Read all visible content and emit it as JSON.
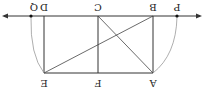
{
  "diagram": {
    "orientation": "rotated-180",
    "labels": {
      "P": "P",
      "B": "B",
      "C": "C",
      "D": "D",
      "Q": "Q",
      "A": "A",
      "F": "F",
      "E": "E"
    },
    "points": {
      "Q": [
        31,
        16
      ],
      "D": [
        44,
        16
      ],
      "C": [
        98,
        16
      ],
      "B": [
        153,
        16
      ],
      "P": [
        177,
        16
      ],
      "E": [
        44,
        73
      ],
      "F": [
        98,
        73
      ],
      "A": [
        153,
        73
      ]
    },
    "segments": [
      "D-E",
      "C-F",
      "B-A",
      "E-A",
      "E-B",
      "C-A"
    ],
    "arcs": [
      "Q-E",
      "P-A"
    ],
    "line": "horizontal line through Q, D, C, B, P with arrows at both ends",
    "colors": {
      "line": "#333333",
      "arc": "#999999"
    }
  }
}
